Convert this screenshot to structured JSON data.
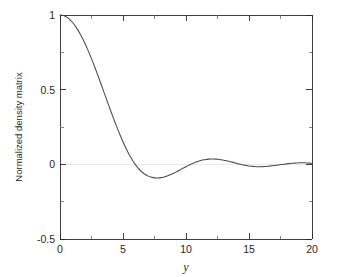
{
  "chart_data": {
    "type": "line",
    "title": "",
    "xlabel": "y",
    "ylabel": "Normalized density matrix",
    "xlim": [
      0,
      20
    ],
    "ylim": [
      -0.5,
      1
    ],
    "grid": false,
    "legend": null,
    "xticks": [
      0,
      5,
      10,
      15,
      20
    ],
    "xticklabels": [
      "0",
      "5",
      "10",
      "15",
      "20"
    ],
    "xminorticks": [
      2.5,
      7.5,
      12.5,
      17.5
    ],
    "yticks": [
      -0.5,
      0,
      0.5,
      1
    ],
    "yticklabels": [
      "-0.5",
      "0",
      "0.5",
      "1"
    ],
    "yminorticks": [
      -0.25,
      0.25,
      0.75
    ],
    "series": [
      {
        "name": "normalized density matrix",
        "color": "#4a4a4a",
        "x": [
          0.0,
          0.2,
          0.4,
          0.6,
          0.8,
          1.0,
          1.2,
          1.4,
          1.6,
          1.8,
          2.0,
          2.2,
          2.4,
          2.6,
          2.8,
          3.0,
          3.2,
          3.4,
          3.6,
          3.8,
          4.0,
          4.2,
          4.4,
          4.6,
          4.8,
          5.0,
          5.2,
          5.4,
          5.6,
          5.8,
          6.0,
          6.2,
          6.4,
          6.6,
          6.8,
          7.0,
          7.2,
          7.4,
          7.6,
          7.8,
          8.0,
          8.2,
          8.4,
          8.6,
          8.8,
          9.0,
          9.2,
          9.4,
          9.6,
          9.8,
          10.0,
          10.2,
          10.4,
          10.6,
          10.8,
          11.0,
          11.2,
          11.4,
          11.6,
          11.8,
          12.0,
          12.2,
          12.4,
          12.6,
          12.8,
          13.0,
          13.2,
          13.4,
          13.6,
          13.8,
          14.0,
          14.2,
          14.4,
          14.6,
          14.8,
          15.0,
          15.2,
          15.4,
          15.6,
          15.8,
          16.0,
          16.2,
          16.4,
          16.6,
          16.8,
          17.0,
          17.2,
          17.4,
          17.6,
          17.8,
          18.0,
          18.2,
          18.4,
          18.6,
          18.8,
          19.0,
          19.2,
          19.4,
          19.6,
          19.8,
          20.0
        ],
        "y": [
          1.0,
          0.998,
          0.992,
          0.982,
          0.968,
          0.95,
          0.928,
          0.902,
          0.873,
          0.841,
          0.806,
          0.768,
          0.728,
          0.686,
          0.642,
          0.597,
          0.551,
          0.504,
          0.457,
          0.41,
          0.364,
          0.318,
          0.274,
          0.231,
          0.19,
          0.151,
          0.114,
          0.08,
          0.049,
          0.021,
          -0.004,
          -0.025,
          -0.043,
          -0.058,
          -0.07,
          -0.079,
          -0.085,
          -0.089,
          -0.091,
          -0.091,
          -0.089,
          -0.086,
          -0.081,
          -0.075,
          -0.068,
          -0.06,
          -0.052,
          -0.043,
          -0.034,
          -0.025,
          -0.016,
          -0.007,
          0.001,
          0.008,
          0.015,
          0.021,
          0.026,
          0.03,
          0.033,
          0.035,
          0.036,
          0.036,
          0.035,
          0.033,
          0.031,
          0.028,
          0.024,
          0.02,
          0.016,
          0.012,
          0.007,
          0.003,
          -0.001,
          -0.005,
          -0.008,
          -0.011,
          -0.013,
          -0.015,
          -0.016,
          -0.016,
          -0.016,
          -0.015,
          -0.014,
          -0.012,
          -0.01,
          -0.008,
          -0.006,
          -0.003,
          -0.001,
          0.001,
          0.003,
          0.005,
          0.007,
          0.008,
          0.009,
          0.01,
          0.01,
          0.01,
          0.009,
          0.008,
          0.007
        ]
      }
    ]
  },
  "axes": {
    "frame_color": "#2b2b2b"
  }
}
